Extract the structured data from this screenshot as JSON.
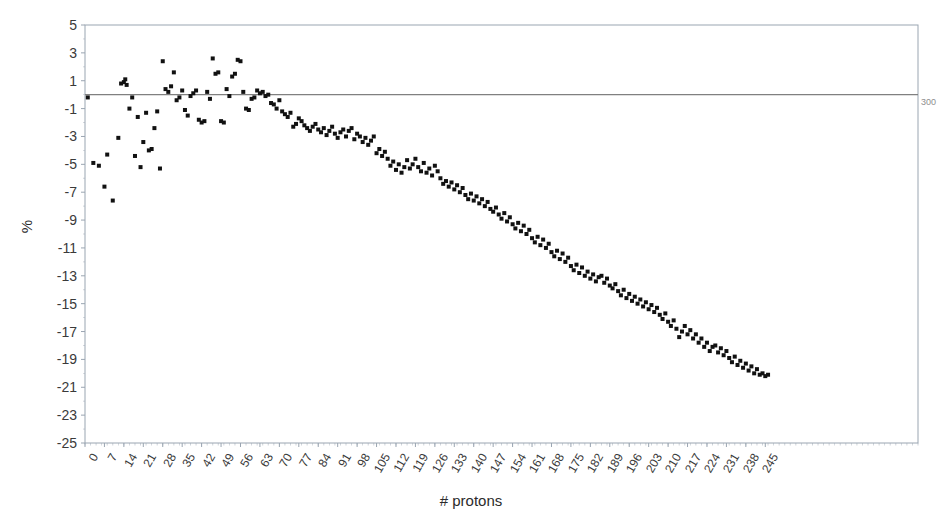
{
  "chart_data": {
    "type": "scatter",
    "title": "",
    "xlabel": "# protons",
    "ylabel": "%",
    "xlim": [
      0,
      300
    ],
    "ylim": [
      -25,
      5
    ],
    "grid": false,
    "legend": null,
    "zero_line": true,
    "right_edge_label": "300",
    "xticks": [
      0,
      7,
      14,
      21,
      28,
      35,
      42,
      49,
      56,
      63,
      70,
      77,
      84,
      91,
      98,
      105,
      112,
      119,
      126,
      133,
      140,
      147,
      154,
      161,
      168,
      175,
      182,
      189,
      196,
      203,
      210,
      217,
      224,
      231,
      238,
      245
    ],
    "yticks": [
      5,
      3,
      1,
      -1,
      -3,
      -5,
      -7,
      -9,
      -11,
      -13,
      -15,
      -17,
      -19,
      -21,
      -23,
      -25
    ],
    "marker": {
      "shape": "square",
      "color": "#111111",
      "size": 4
    },
    "series": [
      {
        "name": "deviation",
        "points": [
          [
            1,
            -0.2
          ],
          [
            3,
            -4.9
          ],
          [
            5,
            -5.1
          ],
          [
            7,
            -6.6
          ],
          [
            8,
            -4.3
          ],
          [
            10,
            -7.6
          ],
          [
            12,
            -3.1
          ],
          [
            13,
            0.8
          ],
          [
            14,
            0.9
          ],
          [
            14.5,
            1.1
          ],
          [
            15,
            0.7
          ],
          [
            16,
            -1.0
          ],
          [
            17,
            -0.2
          ],
          [
            18,
            -4.4
          ],
          [
            19,
            -1.6
          ],
          [
            20,
            -5.2
          ],
          [
            21,
            -3.4
          ],
          [
            22,
            -1.3
          ],
          [
            23,
            -4.0
          ],
          [
            24,
            -3.9
          ],
          [
            25,
            -2.4
          ],
          [
            26,
            -1.2
          ],
          [
            27,
            -5.3
          ],
          [
            28,
            2.4
          ],
          [
            29,
            0.4
          ],
          [
            30,
            0.2
          ],
          [
            31,
            0.6
          ],
          [
            32,
            1.6
          ],
          [
            33,
            -0.4
          ],
          [
            34,
            -0.2
          ],
          [
            35,
            0.3
          ],
          [
            36,
            -1.1
          ],
          [
            37,
            -1.5
          ],
          [
            38,
            -0.1
          ],
          [
            39,
            0.1
          ],
          [
            40,
            0.3
          ],
          [
            41,
            -1.8
          ],
          [
            42,
            -2.0
          ],
          [
            43,
            -1.9
          ],
          [
            44,
            0.2
          ],
          [
            45,
            -0.3
          ],
          [
            46,
            2.6
          ],
          [
            47,
            1.5
          ],
          [
            48,
            1.6
          ],
          [
            49,
            -1.9
          ],
          [
            50,
            -2.0
          ],
          [
            51,
            0.4
          ],
          [
            52,
            -0.1
          ],
          [
            53,
            1.3
          ],
          [
            54,
            1.5
          ],
          [
            55,
            2.5
          ],
          [
            56,
            2.4
          ],
          [
            57,
            0.2
          ],
          [
            58,
            -1.0
          ],
          [
            59,
            -1.1
          ],
          [
            60,
            -0.3
          ],
          [
            61,
            -0.2
          ],
          [
            62,
            0.3
          ],
          [
            63,
            0.1
          ],
          [
            64,
            0.2
          ],
          [
            65,
            -0.1
          ],
          [
            66,
            0.0
          ],
          [
            67,
            -0.6
          ],
          [
            68,
            -0.7
          ],
          [
            69,
            -1.0
          ],
          [
            70,
            -0.4
          ],
          [
            71,
            -1.2
          ],
          [
            72,
            -1.4
          ],
          [
            73,
            -1.6
          ],
          [
            74,
            -1.3
          ],
          [
            75,
            -2.3
          ],
          [
            76,
            -2.1
          ],
          [
            77,
            -1.7
          ],
          [
            78,
            -1.9
          ],
          [
            79,
            -2.2
          ],
          [
            80,
            -2.4
          ],
          [
            81,
            -2.6
          ],
          [
            82,
            -2.3
          ],
          [
            83,
            -2.1
          ],
          [
            84,
            -2.5
          ],
          [
            85,
            -2.7
          ],
          [
            86,
            -2.4
          ],
          [
            87,
            -2.9
          ],
          [
            88,
            -2.6
          ],
          [
            89,
            -2.3
          ],
          [
            90,
            -2.8
          ],
          [
            91,
            -3.1
          ],
          [
            92,
            -2.7
          ],
          [
            93,
            -2.5
          ],
          [
            94,
            -3.0
          ],
          [
            95,
            -2.6
          ],
          [
            96,
            -2.4
          ],
          [
            97,
            -3.2
          ],
          [
            98,
            -2.8
          ],
          [
            99,
            -3.0
          ],
          [
            100,
            -3.4
          ],
          [
            101,
            -3.1
          ],
          [
            102,
            -3.6
          ],
          [
            103,
            -3.3
          ],
          [
            104,
            -3.0
          ],
          [
            105,
            -4.2
          ],
          [
            106,
            -3.9
          ],
          [
            107,
            -4.4
          ],
          [
            108,
            -4.1
          ],
          [
            109,
            -4.6
          ],
          [
            110,
            -5.1
          ],
          [
            111,
            -4.8
          ],
          [
            112,
            -5.4
          ],
          [
            113,
            -5.0
          ],
          [
            114,
            -5.6
          ],
          [
            115,
            -5.2
          ],
          [
            116,
            -4.7
          ],
          [
            117,
            -5.3
          ],
          [
            118,
            -5.0
          ],
          [
            119,
            -4.6
          ],
          [
            120,
            -5.2
          ],
          [
            121,
            -5.5
          ],
          [
            122,
            -4.9
          ],
          [
            123,
            -5.6
          ],
          [
            124,
            -5.3
          ],
          [
            125,
            -5.8
          ],
          [
            126,
            -5.1
          ],
          [
            127,
            -5.5
          ],
          [
            128,
            -6.0
          ],
          [
            129,
            -6.4
          ],
          [
            130,
            -6.2
          ],
          [
            131,
            -6.6
          ],
          [
            132,
            -6.3
          ],
          [
            133,
            -6.8
          ],
          [
            134,
            -6.5
          ],
          [
            135,
            -7.0
          ],
          [
            136,
            -6.7
          ],
          [
            137,
            -7.2
          ],
          [
            138,
            -7.5
          ],
          [
            139,
            -7.1
          ],
          [
            140,
            -7.6
          ],
          [
            141,
            -7.3
          ],
          [
            142,
            -7.8
          ],
          [
            143,
            -7.5
          ],
          [
            144,
            -8.0
          ],
          [
            145,
            -7.7
          ],
          [
            146,
            -8.2
          ],
          [
            147,
            -8.4
          ],
          [
            148,
            -8.1
          ],
          [
            149,
            -8.6
          ],
          [
            150,
            -8.9
          ],
          [
            151,
            -8.5
          ],
          [
            152,
            -9.1
          ],
          [
            153,
            -8.8
          ],
          [
            154,
            -9.3
          ],
          [
            155,
            -9.6
          ],
          [
            156,
            -9.2
          ],
          [
            157,
            -9.8
          ],
          [
            158,
            -9.4
          ],
          [
            159,
            -10.0
          ],
          [
            160,
            -9.7
          ],
          [
            161,
            -10.3
          ],
          [
            162,
            -10.6
          ],
          [
            163,
            -10.2
          ],
          [
            164,
            -10.8
          ],
          [
            165,
            -10.4
          ],
          [
            166,
            -11.0
          ],
          [
            167,
            -10.7
          ],
          [
            168,
            -11.3
          ],
          [
            169,
            -11.6
          ],
          [
            170,
            -11.2
          ],
          [
            171,
            -11.8
          ],
          [
            172,
            -11.4
          ],
          [
            173,
            -12.0
          ],
          [
            174,
            -11.7
          ],
          [
            175,
            -12.3
          ],
          [
            176,
            -12.6
          ],
          [
            177,
            -12.2
          ],
          [
            178,
            -12.8
          ],
          [
            179,
            -12.4
          ],
          [
            180,
            -13.0
          ],
          [
            181,
            -12.7
          ],
          [
            182,
            -13.2
          ],
          [
            183,
            -12.9
          ],
          [
            184,
            -13.4
          ],
          [
            185,
            -13.1
          ],
          [
            186,
            -13.0
          ],
          [
            187,
            -13.5
          ],
          [
            188,
            -13.2
          ],
          [
            189,
            -13.7
          ],
          [
            190,
            -13.9
          ],
          [
            191,
            -13.6
          ],
          [
            192,
            -14.1
          ],
          [
            193,
            -14.4
          ],
          [
            194,
            -14.0
          ],
          [
            195,
            -14.6
          ],
          [
            196,
            -14.3
          ],
          [
            197,
            -14.8
          ],
          [
            198,
            -14.5
          ],
          [
            199,
            -15.0
          ],
          [
            200,
            -14.7
          ],
          [
            201,
            -15.2
          ],
          [
            202,
            -14.9
          ],
          [
            203,
            -15.4
          ],
          [
            204,
            -15.1
          ],
          [
            205,
            -15.6
          ],
          [
            206,
            -15.3
          ],
          [
            207,
            -15.8
          ],
          [
            208,
            -16.1
          ],
          [
            209,
            -15.7
          ],
          [
            210,
            -16.3
          ],
          [
            211,
            -16.6
          ],
          [
            212,
            -16.2
          ],
          [
            213,
            -16.8
          ],
          [
            214,
            -17.4
          ],
          [
            215,
            -17.0
          ],
          [
            216,
            -16.6
          ],
          [
            217,
            -17.2
          ],
          [
            218,
            -16.9
          ],
          [
            219,
            -17.5
          ],
          [
            220,
            -17.2
          ],
          [
            221,
            -17.8
          ],
          [
            222,
            -17.5
          ],
          [
            223,
            -18.1
          ],
          [
            224,
            -17.8
          ],
          [
            225,
            -18.4
          ],
          [
            226,
            -18.1
          ],
          [
            227,
            -18.0
          ],
          [
            228,
            -18.5
          ],
          [
            229,
            -18.2
          ],
          [
            230,
            -18.7
          ],
          [
            231,
            -18.4
          ],
          [
            232,
            -18.9
          ],
          [
            233,
            -19.2
          ],
          [
            234,
            -18.8
          ],
          [
            235,
            -19.4
          ],
          [
            236,
            -19.1
          ],
          [
            237,
            -19.6
          ],
          [
            238,
            -19.3
          ],
          [
            239,
            -19.8
          ],
          [
            240,
            -19.5
          ],
          [
            241,
            -20.0
          ],
          [
            242,
            -19.7
          ],
          [
            243,
            -20.1
          ],
          [
            244,
            -20.0
          ],
          [
            245,
            -20.2
          ],
          [
            246,
            -20.1
          ]
        ]
      }
    ]
  },
  "axis_colors": {
    "frame": "#9aa5b1",
    "tick": "#9aa5b1",
    "zero_line": "#808080",
    "marker": "#111111"
  }
}
